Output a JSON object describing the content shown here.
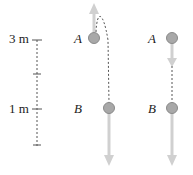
{
  "scale": {
    "labels": [
      {
        "text": "3 m",
        "y": 40
      },
      {
        "text": "1 m",
        "y": 109
      }
    ]
  },
  "scenario_left": {
    "points": [
      {
        "label": "A",
        "x": 98,
        "y": 40
      },
      {
        "label": "B",
        "x": 109,
        "y": 109
      }
    ],
    "motion": "thrown upward, rises then falls past A to B"
  },
  "scenario_right": {
    "points": [
      {
        "label": "A",
        "x": 180,
        "y": 40
      },
      {
        "label": "B",
        "x": 180,
        "y": 109
      }
    ],
    "motion": "dropped from A straight down to B"
  },
  "colors": {
    "ball_fill": "#a8a8a8",
    "ball_stroke": "#8a8a8a",
    "arrow": "#d0d0d0",
    "dashed": "#555555",
    "text": "#222222"
  }
}
